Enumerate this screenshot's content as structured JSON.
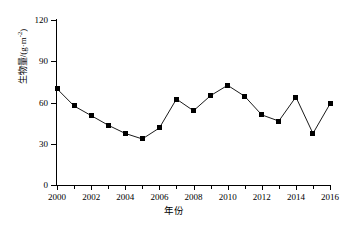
{
  "chart_data": {
    "type": "line",
    "title": "",
    "xlabel": "年份",
    "ylabel": "生物量/(g·m",
    "ylabel_sup": "-2",
    "ylabel_tail": ")",
    "ylabel_full": "生物量/(g·m-2)",
    "categories": [
      2000,
      2001,
      2002,
      2003,
      2004,
      2005,
      2006,
      2007,
      2008,
      2009,
      2010,
      2011,
      2012,
      2013,
      2014,
      2015,
      2016
    ],
    "values": [
      70,
      57.5,
      50.5,
      43.5,
      37.5,
      33.5,
      41.5,
      62.5,
      54,
      65,
      72.5,
      64.5,
      51,
      46.5,
      64,
      37.5,
      59
    ],
    "x": [
      2000,
      2001,
      2002,
      2003,
      2004,
      2005,
      2006,
      2007,
      2008,
      2009,
      2010,
      2011,
      2012,
      2013,
      2014,
      2015,
      2016
    ],
    "xlim": [
      2000,
      2016
    ],
    "ylim": [
      0,
      120
    ],
    "yticks": [
      0,
      30,
      60,
      90,
      120
    ],
    "ytick_labels": [
      "0",
      "30",
      "60",
      "90",
      "120"
    ],
    "xticks": [
      2000,
      2002,
      2004,
      2006,
      2008,
      2010,
      2012,
      2014,
      2016
    ],
    "xtick_labels": [
      "2000",
      "2002",
      "2004",
      "2006",
      "2008",
      "2010",
      "2012",
      "2014",
      "2016"
    ],
    "grid": false,
    "legend": null,
    "marker": "square",
    "marker_color": "#000000",
    "line_color": "#000000",
    "background": "#ffffff"
  }
}
